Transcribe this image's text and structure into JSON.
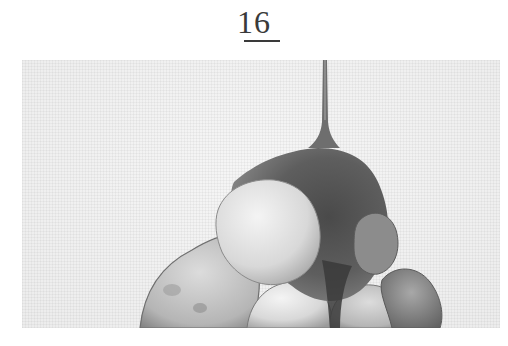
{
  "page": {
    "number": "16"
  },
  "illustration": {
    "subject": "sauce drizzled over a pile of rounded food items",
    "style": "grayscale watercolor",
    "colors": {
      "background": "#f1f1f1",
      "sauce_dark": "#3e3e3e",
      "sauce_mid": "#6a6a6a",
      "item_light": "#e4e4e4",
      "item_mid": "#bdbdbd"
    }
  }
}
